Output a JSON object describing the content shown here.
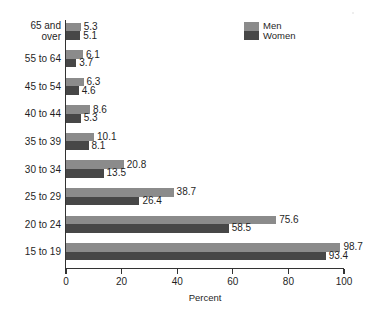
{
  "chart_data": {
    "type": "bar",
    "orientation": "horizontal",
    "title": "",
    "xlabel": "Percent",
    "ylabel": "",
    "xlim": [
      0,
      100
    ],
    "xticks": [
      "0",
      "20",
      "40",
      "60",
      "80",
      "100"
    ],
    "xtick_values": [
      0,
      20,
      40,
      60,
      80,
      100
    ],
    "grid": false,
    "legend_position": "top-right",
    "categories": [
      "65 and over",
      "55 to 64",
      "45 to 54",
      "40 to 44",
      "35 to 39",
      "30 to 34",
      "25 to 29",
      "20 to 24",
      "15 to 19"
    ],
    "category_lines": [
      [
        "65 and",
        "over"
      ],
      [
        "55 to 64"
      ],
      [
        "45 to 54"
      ],
      [
        "40 to 44"
      ],
      [
        "35 to 39"
      ],
      [
        "30 to 34"
      ],
      [
        "25 to 29"
      ],
      [
        "20 to 24"
      ],
      [
        "15 to 19"
      ]
    ],
    "series": [
      {
        "name": "Men",
        "color": "#8b8b8b",
        "values": [
          5.3,
          6.1,
          6.3,
          8.6,
          10.1,
          20.8,
          38.7,
          75.6,
          98.7
        ],
        "labels": [
          "5.3",
          "6.1",
          "6.3",
          "8.6",
          "10.1",
          "20.8",
          "38.7",
          "75.6",
          "98.7"
        ]
      },
      {
        "name": "Women",
        "color": "#474747",
        "values": [
          5.1,
          3.7,
          4.6,
          5.3,
          8.1,
          13.5,
          26.4,
          58.5,
          93.4
        ],
        "labels": [
          "5.1",
          "3.7",
          "4.6",
          "5.3",
          "8.1",
          "13.5",
          "26.4",
          "58.5",
          "93.4"
        ]
      }
    ]
  },
  "legend": {
    "entries": [
      {
        "label": "Men",
        "color": "#8b8b8b"
      },
      {
        "label": "Women",
        "color": "#474747"
      }
    ]
  },
  "colors": {
    "men": "#8b8b8b",
    "women": "#474747",
    "axis": "#333333",
    "text": "#1f1f1f",
    "background": "#ffffff"
  }
}
